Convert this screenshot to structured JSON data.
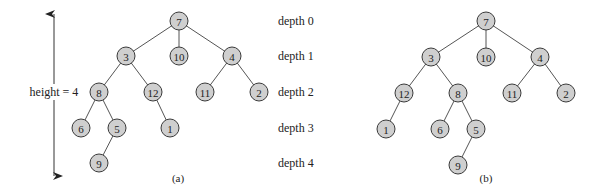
{
  "height_annotation": {
    "label": "height = 4",
    "arrow": {
      "x": 54,
      "y_top": 12,
      "y_bottom": 178
    }
  },
  "depth_labels": [
    {
      "label": "depth 0",
      "y": 21
    },
    {
      "label": "depth 1",
      "y": 56
    },
    {
      "label": "depth 2",
      "y": 92
    },
    {
      "label": "depth 3",
      "y": 128
    },
    {
      "label": "depth 4",
      "y": 163
    }
  ],
  "trees": [
    {
      "caption": "(a)",
      "caption_pos": {
        "x": 178,
        "y": 182
      },
      "nodes": [
        {
          "id": "7",
          "x": 179,
          "y": 21
        },
        {
          "id": "3",
          "x": 126,
          "y": 56
        },
        {
          "id": "10",
          "x": 179,
          "y": 56
        },
        {
          "id": "4",
          "x": 232,
          "y": 56
        },
        {
          "id": "8",
          "x": 99,
          "y": 92
        },
        {
          "id": "12",
          "x": 153,
          "y": 92
        },
        {
          "id": "11",
          "x": 205,
          "y": 92
        },
        {
          "id": "2",
          "x": 259,
          "y": 92
        },
        {
          "id": "6",
          "x": 81,
          "y": 128
        },
        {
          "id": "5",
          "x": 117,
          "y": 128
        },
        {
          "id": "1",
          "x": 170,
          "y": 128
        },
        {
          "id": "9",
          "x": 99,
          "y": 163
        }
      ],
      "edges": [
        [
          "7",
          "3"
        ],
        [
          "7",
          "10"
        ],
        [
          "7",
          "4"
        ],
        [
          "3",
          "8"
        ],
        [
          "3",
          "12"
        ],
        [
          "4",
          "11"
        ],
        [
          "4",
          "2"
        ],
        [
          "8",
          "6"
        ],
        [
          "8",
          "5"
        ],
        [
          "12",
          "1"
        ],
        [
          "5",
          "9"
        ]
      ]
    },
    {
      "caption": "(b)",
      "caption_pos": {
        "x": 486,
        "y": 182
      },
      "nodes": [
        {
          "id": "7",
          "x": 486,
          "y": 21
        },
        {
          "id": "3",
          "x": 431,
          "y": 57
        },
        {
          "id": "10",
          "x": 486,
          "y": 57
        },
        {
          "id": "4",
          "x": 540,
          "y": 57
        },
        {
          "id": "12",
          "x": 404,
          "y": 93
        },
        {
          "id": "8",
          "x": 458,
          "y": 93
        },
        {
          "id": "11",
          "x": 512,
          "y": 93
        },
        {
          "id": "2",
          "x": 566,
          "y": 93
        },
        {
          "id": "1",
          "x": 386,
          "y": 129
        },
        {
          "id": "6",
          "x": 440,
          "y": 129
        },
        {
          "id": "5",
          "x": 476,
          "y": 129
        },
        {
          "id": "9",
          "x": 458,
          "y": 165
        }
      ],
      "edges": [
        [
          "7",
          "3"
        ],
        [
          "7",
          "10"
        ],
        [
          "7",
          "4"
        ],
        [
          "3",
          "12"
        ],
        [
          "3",
          "8"
        ],
        [
          "4",
          "11"
        ],
        [
          "4",
          "2"
        ],
        [
          "12",
          "1"
        ],
        [
          "8",
          "6"
        ],
        [
          "8",
          "5"
        ],
        [
          "5",
          "9"
        ]
      ]
    }
  ],
  "style": {
    "node_fill": "#cfcfcf",
    "node_stroke": "#3a3a3a",
    "edge_color": "#555555",
    "node_radius": 9
  }
}
